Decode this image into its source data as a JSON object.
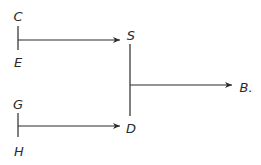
{
  "diagram": {
    "type": "flow",
    "nodes": [
      {
        "id": "C",
        "label": "C",
        "x": 18,
        "y": 16
      },
      {
        "id": "E",
        "label": "E",
        "x": 18,
        "y": 62
      },
      {
        "id": "S",
        "label": "S",
        "x": 131,
        "y": 35
      },
      {
        "id": "G",
        "label": "G",
        "x": 18,
        "y": 104
      },
      {
        "id": "H",
        "label": "H",
        "x": 19,
        "y": 151
      },
      {
        "id": "D",
        "label": "D",
        "x": 131,
        "y": 128
      },
      {
        "id": "B",
        "label": "B.",
        "x": 246,
        "y": 87
      }
    ],
    "edges": [
      {
        "from": "C-E",
        "to": "S"
      },
      {
        "from": "G-H",
        "to": "D"
      },
      {
        "from": "S-D",
        "to": "B"
      }
    ],
    "colors": {
      "line": "#2a2a2a",
      "background": "#ffffff"
    }
  }
}
